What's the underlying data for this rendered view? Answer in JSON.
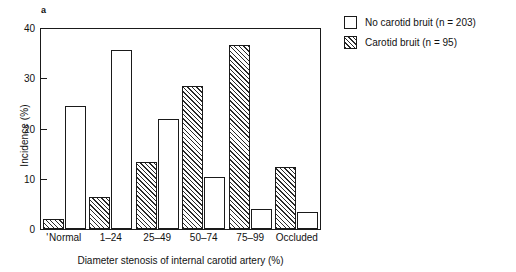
{
  "panel": {
    "label": "a"
  },
  "legend": {
    "position": "top-right",
    "entries": [
      {
        "id": "no-bruit",
        "label": "No carotid bruit (n = 203)",
        "style": "open",
        "color": "#ffffff"
      },
      {
        "id": "bruit",
        "label": "Carotid bruit (n = 95)",
        "style": "hatched",
        "color": "#2a2a2a"
      }
    ]
  },
  "axes": {
    "y_title": "Incidence (%)",
    "x_title": "Diameter stenosis of internal carotid artery (%)",
    "y_ticks": [
      "0",
      "10",
      "20",
      "30",
      "40"
    ]
  },
  "chart_data": {
    "type": "bar",
    "title": "",
    "subtitle": "",
    "xlabel": "Diameter stenosis of internal carotid artery (%)",
    "ylabel": "Incidence (%)",
    "ylim": [
      0,
      40
    ],
    "yticks": [
      0,
      10,
      20,
      30,
      40
    ],
    "grid": false,
    "legend_position": "top-right",
    "annotations": [
      "a"
    ],
    "categories": [
      "Normal",
      "1–24",
      "25–49",
      "50–74",
      "75–99",
      "Occluded"
    ],
    "series": [
      {
        "name": "Carotid bruit (n = 95)",
        "style": "hatched",
        "values": [
          2.0,
          6.4,
          13.3,
          28.4,
          36.7,
          12.4
        ]
      },
      {
        "name": "No carotid bruit (n = 203)",
        "style": "open",
        "values": [
          24.5,
          35.7,
          21.8,
          10.3,
          4.0,
          3.4
        ]
      }
    ]
  }
}
